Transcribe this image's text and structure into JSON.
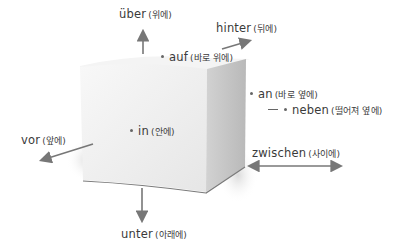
{
  "diagram": {
    "object": "cube",
    "colors": {
      "arrow": "#777777",
      "cube_front": "#efefef",
      "cube_top": "#f6f6f6",
      "cube_side": "#c8c8c8",
      "text": "#3a3a3a"
    },
    "labels": {
      "ueber": {
        "de": "über",
        "ko": "(위에)",
        "marker": "arrow-up"
      },
      "hinter": {
        "de": "hinter",
        "ko": "(뒤에)",
        "marker": "arrow-back"
      },
      "auf": {
        "de": "auf",
        "ko": "(바로 위에)",
        "marker": "dot"
      },
      "an": {
        "de": "an",
        "ko": "(바로 옆에)",
        "marker": "dot"
      },
      "neben": {
        "de": "neben",
        "ko": "(떨어져 옆에)",
        "marker": "dash-dot"
      },
      "in": {
        "de": "in",
        "ko": "(안에)",
        "marker": "dot"
      },
      "vor": {
        "de": "vor",
        "ko": "(앞에)",
        "marker": "arrow-front"
      },
      "zwischen": {
        "de": "zwischen",
        "ko": "(사이에)",
        "marker": "double-arrow"
      },
      "unter": {
        "de": "unter",
        "ko": "(아래에)",
        "marker": "arrow-down"
      }
    }
  }
}
